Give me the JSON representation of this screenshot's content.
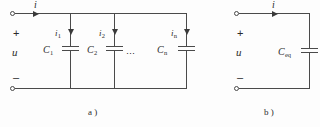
{
  "figure": {
    "background": "#fdfdfd",
    "line_color": "#4a4a4a",
    "text_color": "#2b2b2b"
  },
  "circuit_a": {
    "caption": "a )",
    "source_voltage_label": "u",
    "plus_sign": "+",
    "minus_sign": "–",
    "total_current_label": "i",
    "ellipsis": "⋯",
    "branches": [
      {
        "current_label": "i",
        "current_sub": "1",
        "cap_label": "C",
        "cap_sub": "1"
      },
      {
        "current_label": "i",
        "current_sub": "2",
        "cap_label": "C",
        "cap_sub": "2"
      },
      {
        "current_label": "i",
        "current_sub": "n",
        "cap_label": "C",
        "cap_sub": "n"
      }
    ]
  },
  "circuit_b": {
    "caption": "b )",
    "source_voltage_label": "u",
    "plus_sign": "+",
    "minus_sign": "–",
    "total_current_label": "i",
    "cap_label": "C",
    "cap_sub": "eq"
  }
}
